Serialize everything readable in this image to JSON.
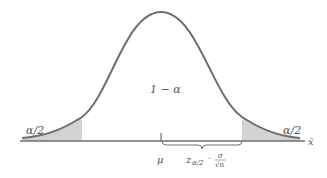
{
  "diagram": {
    "type": "normal-distribution-confidence-interval",
    "center_label": "1 − α",
    "left_tail_label": "α/2",
    "right_tail_label": "α/2",
    "mean_label": "μ",
    "axis_label": "x̄",
    "margin_label": {
      "z": "z",
      "z_sub": "α/2",
      "dot": "·",
      "numerator": "σ",
      "denominator": "√n"
    },
    "colors": {
      "curve": "#6e6e6e",
      "tail_fill": "#d3d3d3",
      "axis": "#6e6e6e",
      "text": "#555555"
    }
  }
}
